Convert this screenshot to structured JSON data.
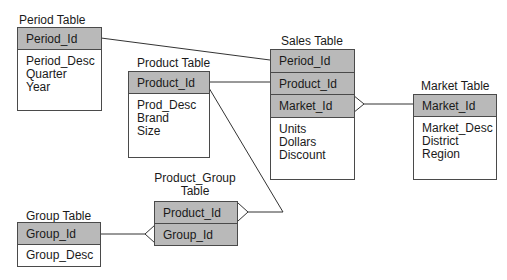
{
  "diagram": {
    "type": "entity-relationship",
    "colors": {
      "key_fill": "#b9b9b9",
      "border": "#4a4a4a",
      "line": "#333333",
      "background": "#ffffff"
    },
    "tables": {
      "period": {
        "title": "Period Table",
        "keys": [
          "Period_Id"
        ],
        "attributes": [
          "Period_Desc",
          "Quarter",
          "Year"
        ]
      },
      "product": {
        "title": "Product Table",
        "keys": [
          "Product_Id"
        ],
        "attributes": [
          "Prod_Desc",
          "Brand",
          "Size"
        ]
      },
      "sales": {
        "title": "Sales Table",
        "keys": [
          "Period_Id",
          "Product_Id",
          "Market_Id"
        ],
        "attributes": [
          "Units",
          "Dollars",
          "Discount"
        ]
      },
      "market": {
        "title": "Market Table",
        "keys": [
          "Market_Id"
        ],
        "attributes": [
          "Market_Desc",
          "District",
          "Region"
        ]
      },
      "product_group": {
        "title_line1": "Product_Group",
        "title_line2": "Table",
        "keys": [
          "Product_Id",
          "Group_Id"
        ],
        "attributes": []
      },
      "group": {
        "title": "Group Table",
        "keys": [
          "Group_Id"
        ],
        "attributes": [
          "Group_Desc"
        ]
      }
    },
    "relationships": [
      {
        "from": "Period Table.Period_Id",
        "to": "Sales Table.Period_Id",
        "cardinality": "one-to-many"
      },
      {
        "from": "Product Table.Product_Id",
        "to": "Sales Table.Product_Id",
        "cardinality": "one-to-many"
      },
      {
        "from": "Market Table.Market_Id",
        "to": "Sales Table.Market_Id",
        "cardinality": "one-to-many"
      },
      {
        "from": "Product Table.Product_Id",
        "to": "Product_Group Table.Product_Id",
        "cardinality": "one-to-many"
      },
      {
        "from": "Group Table.Group_Id",
        "to": "Product_Group Table.Group_Id",
        "cardinality": "one-to-many"
      }
    ]
  }
}
